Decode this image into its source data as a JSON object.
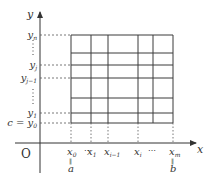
{
  "diagram": {
    "axes": {
      "x_label": "x",
      "y_label": "y",
      "origin_label": "O"
    },
    "x_ticks": [
      {
        "label": "x",
        "sub": "0",
        "pos": 71,
        "below": "a"
      },
      {
        "label": "x",
        "sub": "1",
        "pos": 91
      },
      {
        "label": "x",
        "sub": "i−1",
        "pos": 108
      },
      {
        "label": "x",
        "sub": "i",
        "pos": 138
      },
      {
        "label": "x",
        "sub": "m",
        "pos": 173,
        "below": "b"
      }
    ],
    "x_ellipsis": [
      "⋯",
      "⋯"
    ],
    "y_ticks": [
      {
        "label": "y",
        "sub": "n",
        "pos": 35
      },
      {
        "label": "y",
        "sub": "j",
        "pos": 65
      },
      {
        "label": "y",
        "sub": "j−1",
        "pos": 78
      },
      {
        "label": "y",
        "sub": "1",
        "pos": 113
      },
      {
        "label": "y",
        "sub": "0",
        "pos": 123,
        "prefix": "c ="
      }
    ],
    "y_ellipsis": [
      "⋮",
      "⋮"
    ],
    "grid": {
      "x_lines": [
        71,
        91,
        108,
        138,
        153,
        173
      ],
      "y_lines": [
        35,
        53,
        65,
        78,
        98,
        113,
        123
      ]
    },
    "equals_below": "||",
    "colors": {
      "line": "#333333",
      "grid": "#3a3a3a",
      "guide": "#555555"
    }
  }
}
